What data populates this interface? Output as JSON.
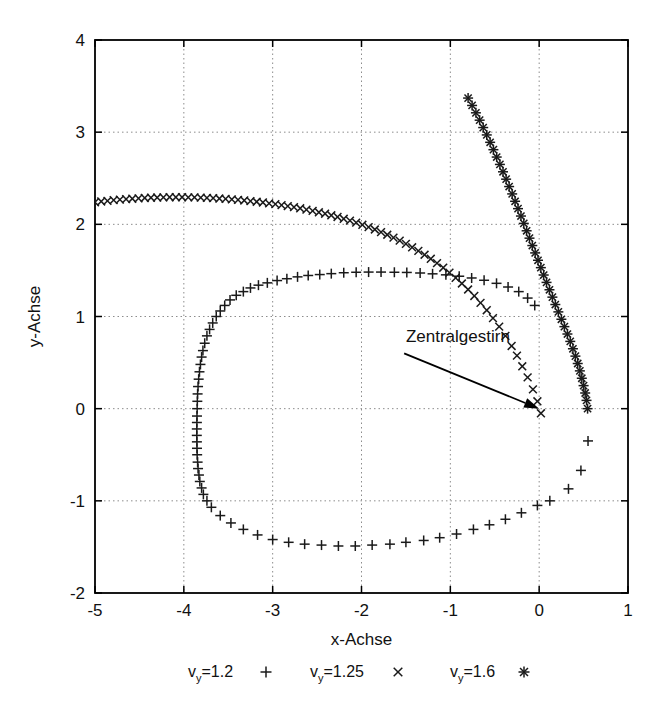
{
  "chart_data": {
    "type": "scatter",
    "title": "",
    "xlabel": "x-Achse",
    "ylabel": "y-Achse",
    "xlim": [
      -5,
      1
    ],
    "ylim": [
      -2,
      4
    ],
    "xticks": [
      "-5",
      "-4",
      "-3",
      "-2",
      "-1",
      "0",
      "1"
    ],
    "yticks": [
      "-2",
      "-1",
      "0",
      "1",
      "2",
      "3",
      "4"
    ],
    "xtick_values": [
      -5,
      -4,
      -3,
      -2,
      -1,
      0,
      1
    ],
    "ytick_values": [
      -2,
      -1,
      0,
      1,
      2,
      3,
      4
    ],
    "grid": true,
    "legend_position": "below-axis",
    "annotations": [
      {
        "text": "Zentralgestirn",
        "text_x": -1.5,
        "text_y": 0.72,
        "arrow_from_x": -1.52,
        "arrow_from_y": 0.6,
        "arrow_to_x": 0.0,
        "arrow_to_y": 0.0
      }
    ],
    "series": [
      {
        "name": "v_y=1.2",
        "legend_label": "v",
        "legend_sub": "y",
        "legend_rest": "=1.2",
        "marker": "plus",
        "color": "#1a1a1a",
        "points": [
          [
            0.55,
            -0.35
          ],
          [
            0.47,
            -0.67
          ],
          [
            0.33,
            -0.87
          ],
          [
            0.12,
            -1.0
          ],
          [
            -0.02,
            -1.05
          ],
          [
            -0.2,
            -1.13
          ],
          [
            -0.38,
            -1.2
          ],
          [
            -0.56,
            -1.26
          ],
          [
            -0.74,
            -1.31
          ],
          [
            -0.93,
            -1.36
          ],
          [
            -1.12,
            -1.4
          ],
          [
            -1.3,
            -1.43
          ],
          [
            -1.5,
            -1.45
          ],
          [
            -1.68,
            -1.47
          ],
          [
            -1.88,
            -1.48
          ],
          [
            -2.07,
            -1.49
          ],
          [
            -2.26,
            -1.49
          ],
          [
            -2.45,
            -1.48
          ],
          [
            -2.64,
            -1.47
          ],
          [
            -2.82,
            -1.45
          ],
          [
            -3.0,
            -1.42
          ],
          [
            -3.17,
            -1.37
          ],
          [
            -3.33,
            -1.31
          ],
          [
            -3.47,
            -1.24
          ],
          [
            -3.59,
            -1.16
          ],
          [
            -3.69,
            -1.07
          ],
          [
            -3.74,
            -1.0
          ],
          [
            -3.78,
            -0.93
          ],
          [
            -3.8,
            -0.86
          ],
          [
            -3.82,
            -0.79
          ],
          [
            -3.83,
            -0.72
          ],
          [
            -3.84,
            -0.65
          ],
          [
            -3.845,
            -0.58
          ],
          [
            -3.85,
            -0.5
          ],
          [
            -3.852,
            -0.43
          ],
          [
            -3.853,
            -0.36
          ],
          [
            -3.854,
            -0.29
          ],
          [
            -3.854,
            -0.22
          ],
          [
            -3.853,
            -0.15
          ],
          [
            -3.852,
            -0.08
          ],
          [
            -3.85,
            0.0
          ],
          [
            -3.848,
            0.08
          ],
          [
            -3.845,
            0.16
          ],
          [
            -3.84,
            0.24
          ],
          [
            -3.833,
            0.32
          ],
          [
            -3.824,
            0.4
          ],
          [
            -3.813,
            0.48
          ],
          [
            -3.8,
            0.56
          ],
          [
            -3.785,
            0.63
          ],
          [
            -3.765,
            0.71
          ],
          [
            -3.74,
            0.79
          ],
          [
            -3.71,
            0.86
          ],
          [
            -3.675,
            0.93
          ],
          [
            -3.635,
            1.0
          ],
          [
            -3.59,
            1.06
          ],
          [
            -3.54,
            1.12
          ],
          [
            -3.48,
            1.18
          ],
          [
            -3.41,
            1.23
          ],
          [
            -3.33,
            1.27
          ],
          [
            -3.25,
            1.31
          ],
          [
            -3.16,
            1.34
          ],
          [
            -3.06,
            1.365
          ],
          [
            -2.95,
            1.39
          ],
          [
            -2.84,
            1.41
          ],
          [
            -2.72,
            1.43
          ],
          [
            -2.6,
            1.445
          ],
          [
            -2.47,
            1.455
          ],
          [
            -2.34,
            1.465
          ],
          [
            -2.2,
            1.475
          ],
          [
            -2.06,
            1.48
          ],
          [
            -1.92,
            1.482
          ],
          [
            -1.78,
            1.482
          ],
          [
            -1.63,
            1.48
          ],
          [
            -1.49,
            1.478
          ],
          [
            -1.34,
            1.472
          ],
          [
            -1.2,
            1.463
          ],
          [
            -1.05,
            1.452
          ],
          [
            -0.9,
            1.437
          ],
          [
            -0.76,
            1.418
          ],
          [
            -0.62,
            1.393
          ],
          [
            -0.48,
            1.36
          ],
          [
            -0.35,
            1.32
          ],
          [
            -0.23,
            1.27
          ],
          [
            -0.13,
            1.2
          ],
          [
            -0.05,
            1.12
          ]
        ]
      },
      {
        "name": "v_y=1.25",
        "legend_label": "v",
        "legend_sub": "y",
        "legend_rest": "=1.25",
        "marker": "cross",
        "color": "#1a1a1a",
        "points": [
          [
            -5.0,
            2.24
          ],
          [
            -4.93,
            2.248
          ],
          [
            -4.86,
            2.255
          ],
          [
            -4.79,
            2.262
          ],
          [
            -4.72,
            2.268
          ],
          [
            -4.65,
            2.273
          ],
          [
            -4.58,
            2.278
          ],
          [
            -4.51,
            2.282
          ],
          [
            -4.44,
            2.286
          ],
          [
            -4.37,
            2.289
          ],
          [
            -4.3,
            2.291
          ],
          [
            -4.23,
            2.293
          ],
          [
            -4.16,
            2.294
          ],
          [
            -4.09,
            2.294
          ],
          [
            -4.02,
            2.294
          ],
          [
            -3.95,
            2.293
          ],
          [
            -3.88,
            2.292
          ],
          [
            -3.81,
            2.29
          ],
          [
            -3.74,
            2.287
          ],
          [
            -3.67,
            2.284
          ],
          [
            -3.6,
            2.28
          ],
          [
            -3.53,
            2.276
          ],
          [
            -3.46,
            2.271
          ],
          [
            -3.39,
            2.265
          ],
          [
            -3.32,
            2.259
          ],
          [
            -3.25,
            2.252
          ],
          [
            -3.18,
            2.245
          ],
          [
            -3.11,
            2.237
          ],
          [
            -3.04,
            2.228
          ],
          [
            -2.97,
            2.219
          ],
          [
            -2.9,
            2.209
          ],
          [
            -2.83,
            2.198
          ],
          [
            -2.76,
            2.186
          ],
          [
            -2.69,
            2.174
          ],
          [
            -2.62,
            2.16
          ],
          [
            -2.55,
            2.146
          ],
          [
            -2.48,
            2.131
          ],
          [
            -2.41,
            2.115
          ],
          [
            -2.34,
            2.098
          ],
          [
            -2.27,
            2.08
          ],
          [
            -2.2,
            2.06
          ],
          [
            -2.13,
            2.04
          ],
          [
            -2.06,
            2.018
          ],
          [
            -1.99,
            1.995
          ],
          [
            -1.92,
            1.97
          ],
          [
            -1.85,
            1.944
          ],
          [
            -1.78,
            1.916
          ],
          [
            -1.71,
            1.887
          ],
          [
            -1.64,
            1.856
          ],
          [
            -1.57,
            1.823
          ],
          [
            -1.5,
            1.788
          ],
          [
            -1.43,
            1.751
          ],
          [
            -1.36,
            1.712
          ],
          [
            -1.29,
            1.67
          ],
          [
            -1.22,
            1.626
          ],
          [
            -1.15,
            1.579
          ],
          [
            -1.08,
            1.529
          ],
          [
            -1.01,
            1.476
          ],
          [
            -0.94,
            1.419
          ],
          [
            -0.87,
            1.358
          ],
          [
            -0.8,
            1.293
          ],
          [
            -0.73,
            1.223
          ],
          [
            -0.66,
            1.148
          ],
          [
            -0.59,
            1.068
          ],
          [
            -0.52,
            0.982
          ],
          [
            -0.45,
            0.89
          ],
          [
            -0.38,
            0.79
          ],
          [
            -0.31,
            0.68
          ],
          [
            -0.25,
            0.575
          ],
          [
            -0.19,
            0.46
          ],
          [
            -0.13,
            0.34
          ],
          [
            -0.07,
            0.21
          ],
          [
            -0.02,
            0.08
          ],
          [
            0.02,
            -0.05
          ]
        ]
      },
      {
        "name": "v_y=1.6",
        "legend_label": "v",
        "legend_sub": "y",
        "legend_rest": "=1.6",
        "marker": "star",
        "color": "#1a1a1a",
        "points": [
          [
            -0.8,
            3.37
          ],
          [
            -0.755,
            3.29
          ],
          [
            -0.712,
            3.21
          ],
          [
            -0.67,
            3.13
          ],
          [
            -0.63,
            3.05
          ],
          [
            -0.59,
            2.97
          ],
          [
            -0.552,
            2.89
          ],
          [
            -0.515,
            2.81
          ],
          [
            -0.478,
            2.73
          ],
          [
            -0.442,
            2.65
          ],
          [
            -0.407,
            2.57
          ],
          [
            -0.372,
            2.49
          ],
          [
            -0.338,
            2.41
          ],
          [
            -0.304,
            2.33
          ],
          [
            -0.271,
            2.25
          ],
          [
            -0.238,
            2.17
          ],
          [
            -0.205,
            2.09
          ],
          [
            -0.173,
            2.01
          ],
          [
            -0.141,
            1.93
          ],
          [
            -0.109,
            1.85
          ],
          [
            -0.077,
            1.77
          ],
          [
            -0.045,
            1.69
          ],
          [
            -0.013,
            1.61
          ],
          [
            0.019,
            1.53
          ],
          [
            0.051,
            1.45
          ],
          [
            0.083,
            1.37
          ],
          [
            0.116,
            1.29
          ],
          [
            0.149,
            1.21
          ],
          [
            0.182,
            1.13
          ],
          [
            0.216,
            1.05
          ],
          [
            0.25,
            0.97
          ],
          [
            0.284,
            0.89
          ],
          [
            0.318,
            0.81
          ],
          [
            0.35,
            0.73
          ],
          [
            0.38,
            0.65
          ],
          [
            0.408,
            0.57
          ],
          [
            0.434,
            0.49
          ],
          [
            0.458,
            0.41
          ],
          [
            0.48,
            0.33
          ],
          [
            0.5,
            0.25
          ],
          [
            0.518,
            0.17
          ],
          [
            0.533,
            0.09
          ],
          [
            0.545,
            0.0
          ]
        ]
      }
    ]
  },
  "plot_box": {
    "left": 95,
    "top": 40,
    "right": 628,
    "bottom": 593
  }
}
